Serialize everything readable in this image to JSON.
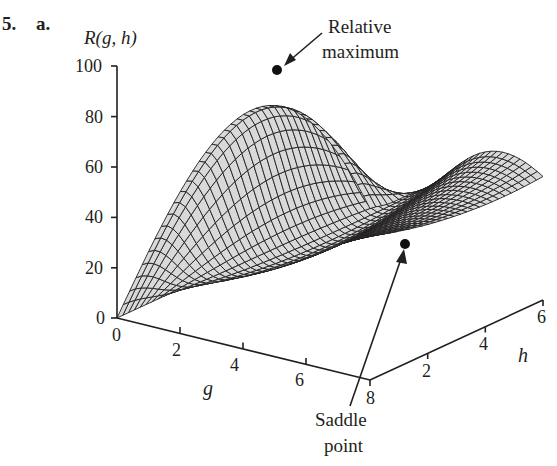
{
  "problem": {
    "number_label": "5.",
    "part_label": "a."
  },
  "chart_data": {
    "type": "surface3d",
    "title": "",
    "zlabel": "R(g, h)",
    "xlabel": "g",
    "ylabel": "h",
    "x_axis": {
      "name": "g",
      "range": [
        0,
        8
      ],
      "ticks": [
        0,
        2,
        4,
        6,
        8
      ]
    },
    "y_axis": {
      "name": "h",
      "range": [
        0,
        6
      ],
      "ticks": [
        2,
        4,
        6
      ]
    },
    "z_axis": {
      "name": "R(g, h)",
      "range": [
        0,
        100
      ],
      "ticks": [
        0,
        20,
        40,
        60,
        80,
        100
      ]
    },
    "surface_color": "#d9d9d9",
    "mesh_color": "#231f20",
    "annotations": [
      {
        "label": "Relative maximum",
        "lines": [
          "Relative",
          "maximum"
        ],
        "g": 5,
        "h": 0.2,
        "R": 100
      },
      {
        "label": "Saddle point",
        "lines": [
          "Saddle",
          "point"
        ],
        "g": 8,
        "h": 1.2,
        "R": 30
      }
    ]
  },
  "labels": {
    "z_title": "R(g, h)",
    "z_ticks": [
      "100",
      "80",
      "60",
      "40",
      "20",
      "0"
    ],
    "g_ticks": [
      "0",
      "2",
      "4",
      "6",
      "8"
    ],
    "h_ticks": [
      "2",
      "4",
      "6"
    ],
    "g_name": "g",
    "h_name": "h",
    "max_line1": "Relative",
    "max_line2": "maximum",
    "saddle_line1": "Saddle",
    "saddle_line2": "point"
  }
}
